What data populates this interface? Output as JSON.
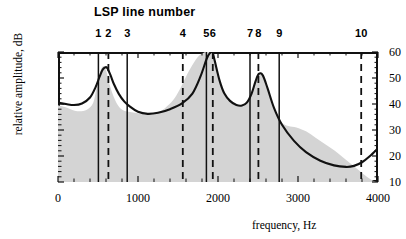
{
  "chart_data": {
    "type": "line",
    "title": "LSP line number",
    "xlabel": "frequency, Hz",
    "ylabel": "relative amplitude, dB",
    "xlim": [
      0,
      4000
    ],
    "ylim": [
      5,
      63
    ],
    "grid": false,
    "legend": "none",
    "xticks": [
      0,
      1000,
      2000,
      3000,
      4000
    ],
    "xtick_labels": [
      "0",
      "1000",
      "2000",
      "3000",
      "4000"
    ],
    "yticks": [
      10,
      20,
      30,
      40,
      50,
      60
    ],
    "ytick_labels": [
      "10",
      "20",
      "30",
      "40",
      "50",
      "60"
    ],
    "series": [
      {
        "name": "LPC spectral envelope",
        "style": "solid-black-line",
        "x": [
          0,
          100,
          200,
          300,
          400,
          470,
          520,
          560,
          600,
          625,
          660,
          700,
          760,
          830,
          900,
          1000,
          1120,
          1250,
          1400,
          1550,
          1680,
          1780,
          1860,
          1900,
          1930,
          1960,
          2020,
          2080,
          2150,
          2230,
          2300,
          2360,
          2420,
          2470,
          2510,
          2560,
          2620,
          2700,
          2800,
          2950,
          3100,
          3280,
          3450,
          3600,
          3700,
          3800,
          3900,
          4000
        ],
        "y": [
          40.5,
          40.0,
          39.6,
          40.2,
          42.5,
          46.5,
          50.5,
          53.3,
          54.2,
          53.3,
          50.8,
          47.6,
          43.9,
          40.9,
          39.0,
          37.0,
          36.2,
          36.6,
          38.0,
          40.2,
          44.0,
          50.5,
          57.5,
          59.6,
          60.0,
          56.5,
          49.0,
          44.0,
          41.2,
          39.6,
          39.4,
          40.5,
          44.0,
          48.8,
          51.6,
          51.0,
          46.0,
          38.5,
          32.0,
          25.8,
          21.5,
          18.2,
          16.4,
          15.8,
          16.2,
          17.6,
          20.0,
          23.0
        ]
      },
      {
        "name": "short-term speech spectrum",
        "style": "gray-shaded-area",
        "x": [
          0,
          120,
          240,
          360,
          440,
          480,
          520,
          560,
          600,
          640,
          700,
          760,
          820,
          880,
          960,
          1040,
          1140,
          1240,
          1340,
          1440,
          1520,
          1600,
          1680,
          1760,
          1840,
          1900,
          1940,
          1990,
          2050,
          2120,
          2200,
          2280,
          2350,
          2420,
          2480,
          2530,
          2600,
          2680,
          2780,
          2880,
          2980,
          3100,
          3220,
          3340,
          3460,
          3560,
          3660,
          3760,
          3860,
          3940,
          4000
        ],
        "y": [
          39.5,
          38.5,
          37.2,
          37.8,
          40.5,
          46.0,
          51.5,
          54.5,
          53.0,
          48.0,
          42.5,
          39.0,
          37.5,
          37.0,
          36.6,
          36.2,
          35.8,
          36.5,
          38.5,
          41.5,
          45.5,
          50.5,
          55.0,
          58.5,
          60.0,
          60.5,
          58.5,
          53.0,
          46.5,
          42.5,
          40.5,
          39.5,
          40.5,
          44.5,
          49.0,
          51.5,
          48.0,
          40.0,
          33.5,
          31.5,
          31.0,
          29.5,
          27.0,
          24.5,
          22.0,
          19.5,
          17.0,
          14.5,
          12.0,
          10.5,
          10.0
        ]
      }
    ],
    "annotations": {
      "lsp_lines_label": "LSP line number",
      "lsp_lines": [
        {
          "number": "1",
          "frequency": 505,
          "style": "solid"
        },
        {
          "number": "2",
          "frequency": 630,
          "style": "dashed"
        },
        {
          "number": "3",
          "frequency": 865,
          "style": "solid"
        },
        {
          "number": "4",
          "frequency": 1560,
          "style": "dashed"
        },
        {
          "number": "5",
          "frequency": 1855,
          "style": "solid"
        },
        {
          "number": "6",
          "frequency": 1935,
          "style": "dashed"
        },
        {
          "number": "7",
          "frequency": 2400,
          "style": "solid"
        },
        {
          "number": "8",
          "frequency": 2505,
          "style": "dashed"
        },
        {
          "number": "9",
          "frequency": 2765,
          "style": "solid"
        },
        {
          "number": "10",
          "frequency": 3790,
          "style": "dashed"
        }
      ]
    }
  },
  "colors": {
    "ink": "#111111",
    "shade": "#d4d4d4",
    "background": "#ffffff"
  }
}
